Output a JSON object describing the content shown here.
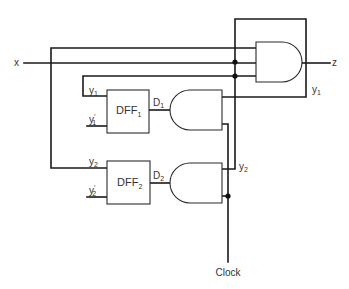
{
  "diagram": {
    "type": "sequential-logic-circuit",
    "inputs": {
      "x": "x",
      "clock": "Clock"
    },
    "outputs": {
      "z": "z"
    },
    "flip_flops": [
      {
        "name": "DFF",
        "sub": "1",
        "input_label": "D",
        "input_sub": "1",
        "q_label": "y",
        "q_sub": "1",
        "qbar_label": "y",
        "qbar_sub": "1",
        "qbar_prime": "′"
      },
      {
        "name": "DFF",
        "sub": "2",
        "input_label": "D",
        "input_sub": "2",
        "q_label": "y",
        "q_sub": "2",
        "qbar_label": "y",
        "qbar_sub": "2",
        "qbar_prime": "′"
      }
    ],
    "gates": [
      {
        "id": "and-output",
        "kind": "AND",
        "inputs": 3,
        "output": "z"
      },
      {
        "id": "and-d1",
        "kind": "AND",
        "inputs": 2,
        "output": "D1"
      },
      {
        "id": "and-d2",
        "kind": "AND",
        "inputs": 2,
        "output": "D2"
      }
    ],
    "wire_labels": {
      "y1_right": {
        "text": "y",
        "sub": "1"
      },
      "y2_right": {
        "text": "y",
        "sub": "2"
      }
    },
    "colors": {
      "wire": "#1a1a1a",
      "background": "#ffffff",
      "text": "#333333"
    }
  }
}
